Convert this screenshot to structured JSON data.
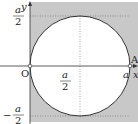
{
  "diagram": {
    "type": "circle-in-square",
    "colors": {
      "shade": "#c8c8c8",
      "line": "#333333",
      "dotted": "#777777",
      "background": "#ffffff"
    },
    "axes": {
      "x_label": "x",
      "y_label": "y",
      "origin_label": "O"
    },
    "points": [
      {
        "name": "A",
        "label": "A",
        "coords": "(a, 0)"
      }
    ],
    "tick_labels": {
      "y_top": {
        "num": "a",
        "den": "2"
      },
      "y_bottom": {
        "sign": "−",
        "num": "a",
        "den": "2"
      },
      "x_mid": {
        "num": "a",
        "den": "2"
      },
      "x_right": "a"
    }
  }
}
